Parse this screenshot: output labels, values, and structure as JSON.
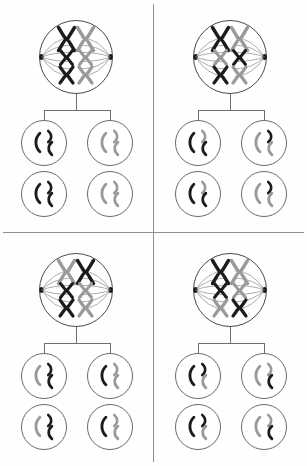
{
  "figure": {
    "width": 307,
    "height": 466,
    "background_color": "#fefefe",
    "divider_color": "#8e8e8e"
  },
  "colors": {
    "maternal_dark": "#1c1c1c",
    "paternal_light": "#9a9a9a",
    "cell_membrane": "#4a4a4a",
    "daughter_membrane": "#6a6a6a",
    "spindle_fiber": "#5d5d5d",
    "centrosome": "#111111",
    "connector_line": "#6f6f6f"
  },
  "legend": {
    "dark_label": "maternal chromosome",
    "light_label": "paternal chromosome"
  },
  "geometry": {
    "parent_cell_diameter": 74,
    "daughter_cell_diameter": 46,
    "chromosome_sizes": [
      {
        "name": "large",
        "height": 22,
        "width": 15
      },
      {
        "name": "medium",
        "height": 14,
        "width": 12
      },
      {
        "name": "small",
        "height": 15,
        "width": 13
      }
    ]
  },
  "quadrants": [
    {
      "id": "quadrant-top-left",
      "label": "Alignment 1",
      "position": {
        "x": 0,
        "y": 0
      },
      "parent_cell": {
        "name": "parent-cell-1",
        "center": {
          "x": 76,
          "y": 57
        },
        "chromosome_pairs": [
          {
            "row": "large",
            "left": "dark",
            "right": "light"
          },
          {
            "row": "medium",
            "left": "dark",
            "right": "light"
          },
          {
            "row": "small",
            "left": "dark",
            "right": "light"
          }
        ]
      },
      "daughter_cells": [
        {
          "name": "daughter-cell-1a",
          "center": {
            "x": 44,
            "y": 143
          },
          "chromatids": [
            {
              "size": "large",
              "color": "dark"
            },
            {
              "size": "medium",
              "color": "dark"
            },
            {
              "size": "small",
              "color": "dark"
            }
          ]
        },
        {
          "name": "daughter-cell-1b",
          "center": {
            "x": 110,
            "y": 143
          },
          "chromatids": [
            {
              "size": "large",
              "color": "light"
            },
            {
              "size": "medium",
              "color": "light"
            },
            {
              "size": "small",
              "color": "light"
            }
          ]
        },
        {
          "name": "daughter-cell-1c",
          "center": {
            "x": 44,
            "y": 194
          },
          "chromatids": [
            {
              "size": "large",
              "color": "dark"
            },
            {
              "size": "medium",
              "color": "dark"
            },
            {
              "size": "small",
              "color": "dark"
            }
          ]
        },
        {
          "name": "daughter-cell-1d",
          "center": {
            "x": 110,
            "y": 194
          },
          "chromatids": [
            {
              "size": "large",
              "color": "light"
            },
            {
              "size": "medium",
              "color": "light"
            },
            {
              "size": "small",
              "color": "light"
            }
          ]
        }
      ]
    },
    {
      "id": "quadrant-top-right",
      "label": "Alignment 2",
      "position": {
        "x": 154,
        "y": 0
      },
      "parent_cell": {
        "name": "parent-cell-2",
        "center": {
          "x": 76,
          "y": 57
        },
        "chromosome_pairs": [
          {
            "row": "large",
            "left": "dark",
            "right": "light"
          },
          {
            "row": "medium",
            "left": "light",
            "right": "dark"
          },
          {
            "row": "small",
            "left": "dark",
            "right": "light"
          }
        ]
      },
      "daughter_cells": [
        {
          "name": "daughter-cell-2a",
          "center": {
            "x": 44,
            "y": 143
          },
          "chromatids": [
            {
              "size": "large",
              "color": "dark"
            },
            {
              "size": "medium",
              "color": "light"
            },
            {
              "size": "small",
              "color": "dark"
            }
          ]
        },
        {
          "name": "daughter-cell-2b",
          "center": {
            "x": 110,
            "y": 143
          },
          "chromatids": [
            {
              "size": "large",
              "color": "light"
            },
            {
              "size": "medium",
              "color": "dark"
            },
            {
              "size": "small",
              "color": "light"
            }
          ]
        },
        {
          "name": "daughter-cell-2c",
          "center": {
            "x": 44,
            "y": 194
          },
          "chromatids": [
            {
              "size": "large",
              "color": "dark"
            },
            {
              "size": "medium",
              "color": "light"
            },
            {
              "size": "small",
              "color": "dark"
            }
          ]
        },
        {
          "name": "daughter-cell-2d",
          "center": {
            "x": 110,
            "y": 194
          },
          "chromatids": [
            {
              "size": "large",
              "color": "light"
            },
            {
              "size": "medium",
              "color": "dark"
            },
            {
              "size": "small",
              "color": "light"
            }
          ]
        }
      ]
    },
    {
      "id": "quadrant-bottom-left",
      "label": "Alignment 3",
      "position": {
        "x": 0,
        "y": 233
      },
      "parent_cell": {
        "name": "parent-cell-3",
        "center": {
          "x": 76,
          "y": 57
        },
        "chromosome_pairs": [
          {
            "row": "large",
            "left": "light",
            "right": "dark"
          },
          {
            "row": "medium",
            "left": "dark",
            "right": "light"
          },
          {
            "row": "small",
            "left": "dark",
            "right": "light"
          }
        ]
      },
      "daughter_cells": [
        {
          "name": "daughter-cell-3a",
          "center": {
            "x": 44,
            "y": 143
          },
          "chromatids": [
            {
              "size": "large",
              "color": "light"
            },
            {
              "size": "medium",
              "color": "dark"
            },
            {
              "size": "small",
              "color": "dark"
            }
          ]
        },
        {
          "name": "daughter-cell-3b",
          "center": {
            "x": 110,
            "y": 143
          },
          "chromatids": [
            {
              "size": "large",
              "color": "dark"
            },
            {
              "size": "medium",
              "color": "light"
            },
            {
              "size": "small",
              "color": "light"
            }
          ]
        },
        {
          "name": "daughter-cell-3c",
          "center": {
            "x": 44,
            "y": 194
          },
          "chromatids": [
            {
              "size": "large",
              "color": "light"
            },
            {
              "size": "medium",
              "color": "dark"
            },
            {
              "size": "small",
              "color": "dark"
            }
          ]
        },
        {
          "name": "daughter-cell-3d",
          "center": {
            "x": 110,
            "y": 194
          },
          "chromatids": [
            {
              "size": "large",
              "color": "dark"
            },
            {
              "size": "medium",
              "color": "light"
            },
            {
              "size": "small",
              "color": "light"
            }
          ]
        }
      ]
    },
    {
      "id": "quadrant-bottom-right",
      "label": "Alignment 4",
      "position": {
        "x": 154,
        "y": 233
      },
      "parent_cell": {
        "name": "parent-cell-4",
        "center": {
          "x": 76,
          "y": 57
        },
        "chromosome_pairs": [
          {
            "row": "large",
            "left": "dark",
            "right": "light"
          },
          {
            "row": "medium",
            "left": "dark",
            "right": "light"
          },
          {
            "row": "small",
            "left": "light",
            "right": "dark"
          }
        ]
      },
      "daughter_cells": [
        {
          "name": "daughter-cell-4a",
          "center": {
            "x": 44,
            "y": 143
          },
          "chromatids": [
            {
              "size": "large",
              "color": "dark"
            },
            {
              "size": "medium",
              "color": "dark"
            },
            {
              "size": "small",
              "color": "light"
            }
          ]
        },
        {
          "name": "daughter-cell-4b",
          "center": {
            "x": 110,
            "y": 143
          },
          "chromatids": [
            {
              "size": "large",
              "color": "light"
            },
            {
              "size": "medium",
              "color": "light"
            },
            {
              "size": "small",
              "color": "dark"
            }
          ]
        },
        {
          "name": "daughter-cell-4c",
          "center": {
            "x": 44,
            "y": 194
          },
          "chromatids": [
            {
              "size": "large",
              "color": "dark"
            },
            {
              "size": "medium",
              "color": "dark"
            },
            {
              "size": "small",
              "color": "light"
            }
          ]
        },
        {
          "name": "daughter-cell-4d",
          "center": {
            "x": 110,
            "y": 194
          },
          "chromatids": [
            {
              "size": "light",
              "color": "light"
            },
            {
              "size": "medium",
              "color": "light"
            },
            {
              "size": "small",
              "color": "dark"
            }
          ]
        }
      ]
    }
  ]
}
